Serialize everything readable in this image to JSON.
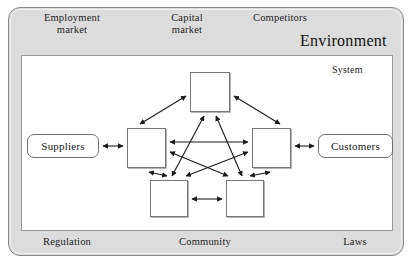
{
  "diagram": {
    "environment": {
      "title": "Environment",
      "labels": {
        "employment_market": "Employment\nmarket",
        "capital_market": "Capital\nmarket",
        "competitors": "Competitors",
        "regulation": "Regulation",
        "community": "Community",
        "laws": "Laws"
      },
      "fill_color": "#dcdcdc",
      "border_color": "#8a8a8a"
    },
    "system": {
      "label": "System",
      "fill_color": "#ffffff",
      "border_color": "#9a9a9a"
    },
    "parties": {
      "suppliers": "Suppliers",
      "customers": "Customers"
    },
    "nodes": [
      {
        "id": "top",
        "label": ""
      },
      {
        "id": "left",
        "label": ""
      },
      {
        "id": "right",
        "label": ""
      },
      {
        "id": "bottom-left",
        "label": ""
      },
      {
        "id": "bottom-right",
        "label": ""
      }
    ],
    "connections": [
      {
        "from": "suppliers",
        "to": "left",
        "style": "double-arrow"
      },
      {
        "from": "right",
        "to": "customers",
        "style": "double-arrow"
      },
      {
        "from": "left",
        "to": "top",
        "style": "double-arrow"
      },
      {
        "from": "top",
        "to": "right",
        "style": "double-arrow"
      },
      {
        "from": "left",
        "to": "right",
        "style": "double-arrow"
      },
      {
        "from": "left",
        "to": "bottom-left",
        "style": "double-arrow"
      },
      {
        "from": "right",
        "to": "bottom-right",
        "style": "double-arrow"
      },
      {
        "from": "bottom-left",
        "to": "bottom-right",
        "style": "double-arrow"
      },
      {
        "from": "bottom-left",
        "to": "top",
        "style": "double-arrow"
      },
      {
        "from": "bottom-right",
        "to": "top",
        "style": "double-arrow"
      },
      {
        "from": "left",
        "to": "bottom-right",
        "style": "double-arrow"
      },
      {
        "from": "right",
        "to": "bottom-left",
        "style": "double-arrow"
      }
    ],
    "line_color": "#1a1a1a"
  }
}
